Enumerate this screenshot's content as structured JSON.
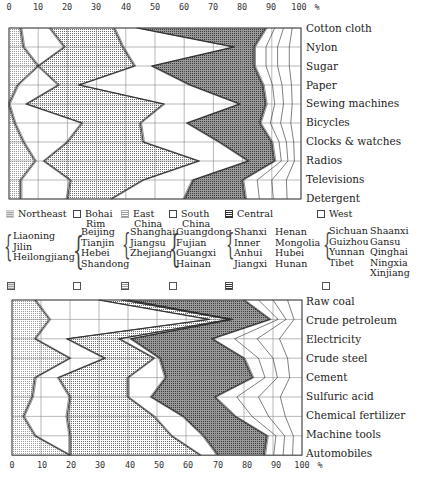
{
  "axis": {
    "ticks": [
      "0",
      "10",
      "20",
      "30",
      "40",
      "50",
      "60",
      "70",
      "80",
      "90",
      "100"
    ],
    "unit": "%"
  },
  "top_chart": {
    "rows": [
      "Cotton cloth",
      "Nylon",
      "Sugar",
      "Paper",
      "Sewing machines",
      "Bicycles",
      "Clocks & watches",
      "Radios",
      "Televisions",
      "Detergent"
    ]
  },
  "bottom_chart": {
    "rows": [
      "Raw coal",
      "Crude petroleum",
      "Electricity",
      "Crude steel",
      "Cement",
      "Sulfuric acid",
      "Chemical fertilizer",
      "Machine tools",
      "Automobiles"
    ]
  },
  "legend": {
    "regions": [
      {
        "name": "Northeast",
        "line2": "",
        "pattern": "light-dots",
        "provinces": [
          "Liaoning",
          "Jilin",
          "Heilongjiang"
        ]
      },
      {
        "name": "Bohai",
        "line2": "Rim",
        "pattern": "blank",
        "provinces": [
          "Beijing",
          "Tianjin",
          "Hebei",
          "Shandong"
        ]
      },
      {
        "name": "East",
        "line2": "China",
        "pattern": "medium-dots",
        "provinces": [
          "Shanghai",
          "Jiangsu",
          "Zhejiang"
        ]
      },
      {
        "name": "South",
        "line2": "China",
        "pattern": "blank",
        "provinces": [
          "Guangdong",
          "Fujian",
          "Guangxi",
          "Hainan"
        ]
      },
      {
        "name": "Central",
        "line2": "",
        "pattern": "dense-grid",
        "provinces_col1": [
          "Shanxi",
          "Inner",
          "Anhui",
          "Jiangxi"
        ],
        "provinces_col2": [
          "Henan",
          "Mongolia",
          "Hubei",
          "Hunan"
        ]
      },
      {
        "name": "West",
        "line2": "",
        "pattern": "blank",
        "provinces_col1": [
          "Sichuan",
          "Guizhou",
          "Yunnan",
          "Tibet"
        ],
        "provinces_col2": [
          "Shaanxi",
          "Gansu",
          "Qinghai",
          "Ningxia",
          "Xinjiang"
        ]
      }
    ]
  },
  "colors": {
    "frame": "#444444",
    "grid": "#8a8a8a",
    "line": "#2a2a2a",
    "northeast_fill": "#d9d9d9",
    "bohai_fill": "#ffffff",
    "east_fill": "#c4c4c4",
    "south_fill": "#ffffff",
    "central_fill": "#8f8f8f",
    "west_fill": "#ffffff"
  },
  "chart_data": [
    {
      "type": "area",
      "orientation": "horizontal-stacked-profile",
      "title": "",
      "xlabel": "%",
      "ylabel": "",
      "xlim": [
        0,
        100
      ],
      "grid": true,
      "legend_position": "between charts",
      "categories": [
        "Cotton cloth",
        "Nylon",
        "Sugar",
        "Paper",
        "Sewing machines",
        "Bicycles",
        "Clocks & watches",
        "Radios",
        "Televisions",
        "Detergent"
      ],
      "series": [
        {
          "name": "Northeast",
          "values": [
            4,
            5,
            10,
            3,
            0,
            2,
            5,
            9,
            4,
            4
          ]
        },
        {
          "name": "Bohai Rim",
          "values": [
            10,
            14,
            0,
            14,
            6,
            23,
            15,
            3,
            17,
            16
          ]
        },
        {
          "name": "East China",
          "values": [
            22,
            20,
            33,
            7,
            47,
            20,
            26,
            53,
            25,
            15
          ]
        },
        {
          "name": "South China",
          "values": [
            8,
            38,
            6,
            38,
            26,
            16,
            26,
            17,
            17,
            25
          ]
        },
        {
          "name": "Central",
          "values": [
            44,
            7,
            35,
            25,
            9,
            25,
            18,
            9,
            17,
            21
          ]
        },
        {
          "name": "West",
          "values": [
            12,
            16,
            16,
            13,
            12,
            14,
            10,
            9,
            20,
            19
          ]
        }
      ],
      "boundaries_cumulative": [
        [
          4,
          14,
          36,
          44,
          88,
          100
        ],
        [
          5,
          19,
          39,
          77,
          84,
          100
        ],
        [
          10,
          10,
          43,
          49,
          84,
          100
        ],
        [
          3,
          17,
          24,
          62,
          87,
          100
        ],
        [
          0,
          6,
          53,
          79,
          88,
          100
        ],
        [
          2,
          25,
          45,
          61,
          86,
          100
        ],
        [
          5,
          20,
          46,
          72,
          90,
          100
        ],
        [
          9,
          12,
          65,
          82,
          91,
          100
        ],
        [
          4,
          21,
          46,
          63,
          80,
          100
        ],
        [
          4,
          20,
          35,
          60,
          81,
          100
        ]
      ]
    },
    {
      "type": "area",
      "orientation": "horizontal-stacked-profile",
      "title": "",
      "xlabel": "%",
      "ylabel": "",
      "xlim": [
        0,
        100
      ],
      "grid": true,
      "categories": [
        "Raw coal",
        "Crude petroleum",
        "Electricity",
        "Crude steel",
        "Cement",
        "Sulfuric acid",
        "Chemical fertilizer",
        "Machine tools",
        "Automobiles"
      ],
      "series": [
        {
          "name": "Northeast",
          "values": [
            8,
            13,
            8,
            20,
            8,
            7,
            4,
            8,
            20
          ]
        },
        {
          "name": "Bohai Rim",
          "values": [
            22,
            55,
            11,
            12,
            8,
            13,
            15,
            12,
            0
          ]
        },
        {
          "name": "East China",
          "values": [
            8,
            7,
            18,
            17,
            24,
            20,
            30,
            35,
            45
          ]
        },
        {
          "name": "South China",
          "values": [
            2,
            1,
            4,
            2,
            13,
            8,
            10,
            11,
            6
          ]
        },
        {
          "name": "Central",
          "values": [
            40,
            13,
            28,
            29,
            30,
            22,
            18,
            22,
            16
          ]
        },
        {
          "name": "West",
          "values": [
            20,
            11,
            31,
            20,
            17,
            30,
            23,
            12,
            13
          ]
        }
      ],
      "boundaries_cumulative": [
        [
          8,
          30,
          38,
          40,
          80,
          100
        ],
        [
          13,
          68,
          75,
          76,
          89,
          100
        ],
        [
          8,
          19,
          37,
          41,
          69,
          100
        ],
        [
          20,
          32,
          49,
          51,
          80,
          100
        ],
        [
          8,
          16,
          40,
          53,
          83,
          100
        ],
        [
          7,
          20,
          40,
          48,
          70,
          100
        ],
        [
          4,
          19,
          49,
          59,
          77,
          100
        ],
        [
          8,
          20,
          55,
          66,
          88,
          100
        ],
        [
          20,
          20,
          65,
          71,
          87,
          100
        ]
      ]
    }
  ]
}
